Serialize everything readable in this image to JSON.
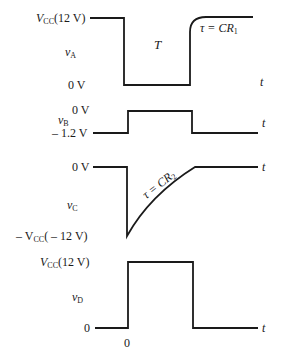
{
  "diagram": {
    "stroke_color": "#1a1a1a",
    "waveforms": [
      {
        "name": "vA",
        "symbol": "v",
        "subscript": "A",
        "levels": {
          "high": "V",
          "high_sub": "CC",
          "high_value": "(12 V)",
          "low": "0 V"
        },
        "pulse_label": "T",
        "time_constant": {
          "tau": "τ = CR",
          "sub": "1"
        },
        "axis": "t"
      },
      {
        "name": "vB",
        "symbol": "v",
        "subscript": "B",
        "levels": {
          "high": "0 V",
          "low": "– 1.2 V"
        },
        "axis": "t"
      },
      {
        "name": "vC",
        "symbol": "v",
        "subscript": "C",
        "levels": {
          "high": "0 V",
          "low_prefix": "– V",
          "low_sub": "CC",
          "low_value": "( – 12 V)"
        },
        "time_constant": {
          "tau": "τ = CR",
          "sub": "2"
        },
        "axis": "t"
      },
      {
        "name": "vD",
        "symbol": "v",
        "subscript": "D",
        "levels": {
          "high": "V",
          "high_sub": "CC",
          "high_value": "(12 V)",
          "low": "0"
        },
        "axis": "t",
        "origin_label": "0"
      }
    ]
  }
}
